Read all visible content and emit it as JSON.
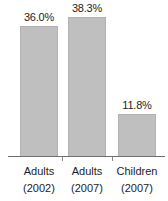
{
  "chart_data": {
    "type": "bar",
    "title": "",
    "xlabel": "",
    "ylabel": "",
    "categories": [
      "Adults (2002)",
      "Adults (2007)",
      "Children (2007)"
    ],
    "category_lines": [
      {
        "line1": "Adults",
        "line2": "(2002)"
      },
      {
        "line1": "Adults",
        "line2": "(2007)"
      },
      {
        "line1": "Children",
        "line2": "(2007)"
      }
    ],
    "values": [
      36.0,
      38.3,
      11.8
    ],
    "value_labels": [
      "36.0%",
      "38.3%",
      "11.8%"
    ],
    "ylim": [
      0,
      43
    ],
    "grid": false,
    "legend": false,
    "bar_color": "#bfbfbf",
    "bar_edge_color": "#b2b2b2",
    "axis_color": "#6f6f6f",
    "text_color": "#1d1d1d",
    "background_color": "#ffffff"
  }
}
